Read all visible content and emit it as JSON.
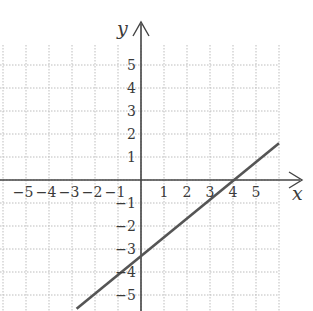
{
  "chart_data": {
    "type": "line",
    "title": "",
    "xlabel": "x",
    "ylabel": "y",
    "xlim": [
      -6,
      6
    ],
    "ylim": [
      -6,
      6
    ],
    "grid": true,
    "x_ticks": [
      "-5",
      "-4",
      "-3",
      "-2",
      "-1",
      "1",
      "2",
      "3",
      "4",
      "5"
    ],
    "y_ticks": [
      "5",
      "4",
      "3",
      "2",
      "1",
      "-1",
      "-2",
      "-3",
      "-4",
      "-5"
    ],
    "series": [
      {
        "name": "line",
        "equation": "y = 0.75x - 3",
        "slope": 0.75,
        "y_intercept": -3,
        "x_intercept": 4,
        "points": [
          [
            -2.8,
            -5.6
          ],
          [
            0,
            -3
          ],
          [
            4,
            0
          ],
          [
            6,
            1.6
          ]
        ],
        "color": "#555555"
      }
    ]
  },
  "colors": {
    "axis": "#444444",
    "grid": "#bdbdbd",
    "line": "#555555",
    "text": "#3a3a3a"
  }
}
